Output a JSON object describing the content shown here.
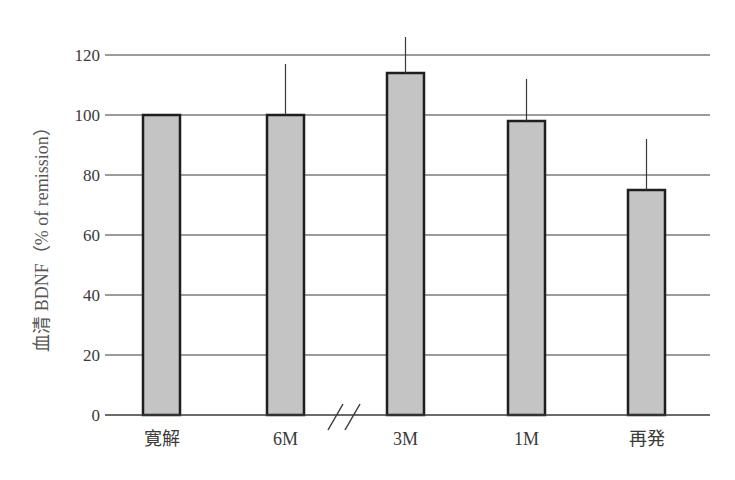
{
  "chart_data": {
    "type": "bar",
    "title": "",
    "xlabel": "",
    "ylabel": "血清 BDNF（% of remission）",
    "categories": [
      "寛解",
      "6M",
      "3M",
      "1M",
      "再発"
    ],
    "series": [
      {
        "name": "血清 BDNF",
        "values": [
          100,
          100,
          114,
          98,
          75
        ],
        "error_upper": [
          null,
          117,
          126,
          112,
          92
        ]
      }
    ],
    "ylim": [
      0,
      120
    ],
    "yticks": [
      0,
      20,
      40,
      60,
      80,
      100,
      120
    ],
    "grid": true,
    "legend": null,
    "annotations": [
      "axis break (//) between 6M and 3M"
    ]
  },
  "colors": {
    "bar_fill": "#c4c4c4",
    "bar_edge": "#1e1e1e",
    "grid": "#3a3a3a",
    "text": "#3a3a3a"
  }
}
